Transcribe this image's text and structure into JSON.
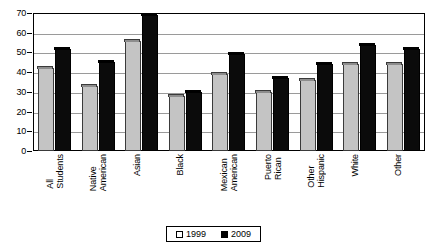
{
  "chart_data": {
    "type": "bar",
    "title": "",
    "xlabel": "",
    "ylabel": "",
    "ylim": [
      0,
      70
    ],
    "yticks": [
      0,
      10,
      20,
      30,
      40,
      50,
      60,
      70
    ],
    "grid": true,
    "legend_position": "bottom",
    "categories": [
      "All\nStudents",
      "Native\nAmerican",
      "Asian",
      "Black",
      "Mexican\nAmerican",
      "Puerto\nRican",
      "Other\nHispanic",
      "White",
      "Other"
    ],
    "series": [
      {
        "name": "1999",
        "color": "#c4c4c4",
        "values": [
          42,
          33,
          56,
          28,
          39,
          30,
          36,
          44,
          44
        ]
      },
      {
        "name": "2009",
        "color": "#000000",
        "values": [
          52,
          45,
          69,
          30,
          49,
          37,
          44,
          54,
          52
        ]
      }
    ]
  },
  "legend": {
    "items": [
      {
        "label": "1999",
        "swatch": "open-square-swatch"
      },
      {
        "label": "2009",
        "swatch": "filled-square-swatch"
      }
    ]
  }
}
